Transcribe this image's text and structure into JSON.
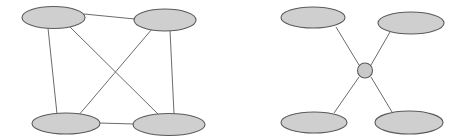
{
  "figure": {
    "background_color": "#ffffff",
    "node_fill_color": "#cfcfcf",
    "node_stroke_color": "#5a5a5a",
    "edge_color": "#6b6b6b",
    "hub_fill_color": "#c9c9c9",
    "width": 465,
    "height": 140
  },
  "chart_data": {
    "type": "diagram",
    "diagram_kind": "node-link-graph",
    "title": "",
    "panels": [
      {
        "id": "left-graph",
        "name": "fully-connected-mesh",
        "topology": "mesh",
        "node_count": 4,
        "edge_count": 6,
        "nodes": [
          {
            "id": "L1",
            "label": "",
            "shape": "ellipse",
            "cx": 53.5,
            "cy": 17.5,
            "rx": 31.5,
            "ry": 11.0
          },
          {
            "id": "L2",
            "label": "",
            "shape": "ellipse",
            "cx": 165.0,
            "cy": 20.0,
            "rx": 31.0,
            "ry": 11.0
          },
          {
            "id": "L3",
            "label": "",
            "shape": "ellipse",
            "cx": 66.0,
            "cy": 123.5,
            "rx": 34.0,
            "ry": 10.5
          },
          {
            "id": "L4",
            "label": "",
            "shape": "ellipse",
            "cx": 169.0,
            "cy": 124.5,
            "rx": 36.0,
            "ry": 11.0
          }
        ],
        "edges": [
          {
            "from": "L1",
            "to": "L2",
            "kind": "top-horizontal"
          },
          {
            "from": "L3",
            "to": "L4",
            "kind": "bottom-horizontal"
          },
          {
            "from": "L1",
            "to": "L3",
            "kind": "left-vertical"
          },
          {
            "from": "L2",
            "to": "L4",
            "kind": "right-vertical"
          },
          {
            "from": "L1",
            "to": "L4",
            "kind": "diagonal"
          },
          {
            "from": "L2",
            "to": "L3",
            "kind": "diagonal"
          }
        ]
      },
      {
        "id": "right-graph",
        "name": "star-hub-topology",
        "topology": "star",
        "node_count": 5,
        "edge_count": 4,
        "nodes": [
          {
            "id": "R1",
            "label": "",
            "shape": "ellipse",
            "cx": 313.0,
            "cy": 17.5,
            "rx": 32.0,
            "ry": 10.5
          },
          {
            "id": "R2",
            "label": "",
            "shape": "ellipse",
            "cx": 411.0,
            "cy": 23.0,
            "rx": 33.0,
            "ry": 11.0
          },
          {
            "id": "R3",
            "label": "",
            "shape": "ellipse",
            "cx": 314.0,
            "cy": 122.5,
            "rx": 33.0,
            "ry": 10.5
          },
          {
            "id": "R4",
            "label": "",
            "shape": "ellipse",
            "cx": 409.0,
            "cy": 122.5,
            "rx": 34.0,
            "ry": 11.5
          },
          {
            "id": "HUB",
            "label": "",
            "shape": "circle",
            "cx": 365.0,
            "cy": 70.5,
            "r": 7.5
          }
        ],
        "edges": [
          {
            "from": "R1",
            "to": "HUB",
            "kind": "spoke"
          },
          {
            "from": "R2",
            "to": "HUB",
            "kind": "spoke"
          },
          {
            "from": "R3",
            "to": "HUB",
            "kind": "spoke"
          },
          {
            "from": "R4",
            "to": "HUB",
            "kind": "spoke"
          }
        ]
      }
    ]
  }
}
